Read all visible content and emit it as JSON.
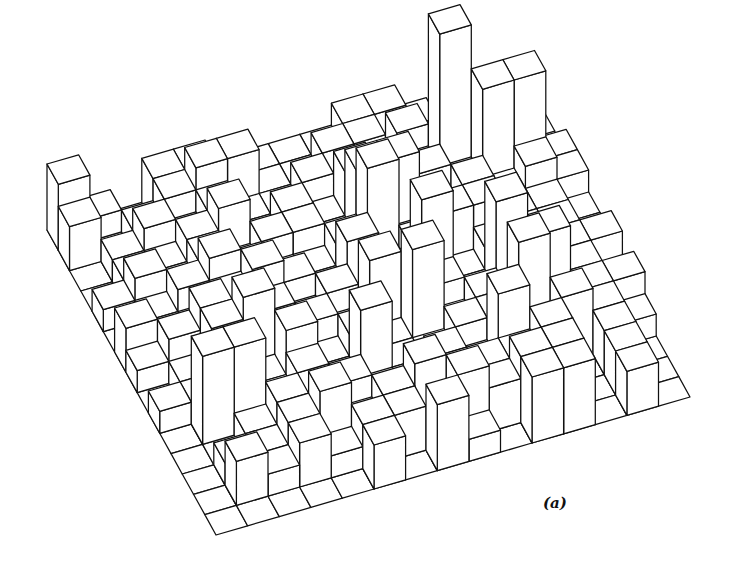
{
  "figure": {
    "caption": "(a)",
    "caption_pos": [
      543,
      494
    ],
    "line_color": "#111111",
    "face_color": "#ffffff",
    "background": "#ffffff"
  },
  "chart_data": {
    "type": "bar3d",
    "title": "",
    "caption": "(a)",
    "rows": 15,
    "cols": 15,
    "grid_on_base": true,
    "projection": {
      "left_corner": [
        47,
        230
      ],
      "row_step": [
        11.27,
        20.33
      ],
      "col_step": [
        31.6,
        -9.2
      ],
      "unit_height_px": 22
    },
    "heights": [
      [
        3,
        1,
        0,
        2,
        2,
        0,
        1,
        1,
        1,
        2,
        2,
        1,
        0,
        0,
        0
      ],
      [
        2,
        0,
        1,
        2,
        3,
        3,
        1,
        1,
        2,
        2,
        1,
        0,
        1,
        0,
        0
      ],
      [
        0,
        1,
        2,
        1,
        2,
        1,
        1,
        2,
        1,
        1,
        3,
        1,
        0,
        0,
        1
      ],
      [
        0,
        1,
        1,
        2,
        3,
        1,
        2,
        1,
        3,
        2,
        2,
        8,
        1,
        0,
        0
      ],
      [
        1,
        2,
        1,
        2,
        1,
        2,
        2,
        1,
        4,
        4,
        3,
        2,
        6,
        6,
        2
      ],
      [
        0,
        1,
        2,
        3,
        2,
        1,
        1,
        2,
        5,
        1,
        2,
        3,
        2,
        3,
        2
      ],
      [
        2,
        1,
        1,
        2,
        3,
        2,
        1,
        3,
        1,
        2,
        3,
        3,
        2,
        2,
        1
      ],
      [
        1,
        2,
        3,
        1,
        2,
        1,
        2,
        1,
        2,
        5,
        1,
        2,
        2,
        2,
        1
      ],
      [
        0,
        1,
        3,
        4,
        1,
        2,
        1,
        4,
        1,
        2,
        1,
        5,
        2,
        2,
        2
      ],
      [
        1,
        1,
        2,
        1,
        3,
        1,
        2,
        1,
        5,
        1,
        2,
        1,
        4,
        2,
        0
      ],
      [
        0,
        4,
        4,
        1,
        2,
        1,
        4,
        1,
        1,
        2,
        2,
        5,
        1,
        2,
        2
      ],
      [
        0,
        0,
        1,
        2,
        1,
        2,
        1,
        1,
        2,
        1,
        4,
        1,
        3,
        2,
        1
      ],
      [
        0,
        1,
        1,
        2,
        3,
        1,
        2,
        3,
        2,
        2,
        2,
        3,
        0,
        2,
        0
      ],
      [
        0,
        2,
        1,
        2,
        1,
        2,
        2,
        1,
        3,
        2,
        3,
        3,
        0,
        2,
        0
      ],
      [
        0,
        0,
        0,
        0,
        0,
        2,
        0,
        3,
        1,
        0,
        3,
        3,
        0,
        2,
        0
      ]
    ],
    "xlabel": "",
    "ylabel": "",
    "zlabel": ""
  }
}
